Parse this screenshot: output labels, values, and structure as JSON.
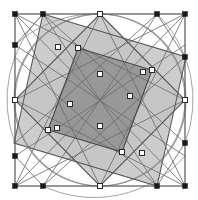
{
  "figure": {
    "type": "geometric-diagram",
    "canvas": {
      "width": 198,
      "height": 200,
      "background": "#ffffff"
    }
  },
  "colors": {
    "background": "#ffffff",
    "stroke_dark": "#3a3a3a",
    "stroke_mid": "#6e6e6e",
    "stroke_light": "#9a9a9a",
    "fill_light_gray": "#c4c4c4",
    "fill_dark_gray": "#989898",
    "node_filled": "#1a1a1a",
    "node_open_fill": "#ffffff",
    "node_open_stroke": "#2a2a2a"
  },
  "frame": {
    "name": "outer-square",
    "x": 15,
    "y": 14,
    "width": 170,
    "height": 172,
    "stroke": "#555555",
    "stroke_width": 1.2
  },
  "circle": {
    "name": "inscribed-circle",
    "cx": 100,
    "cy": 100,
    "r": 86,
    "stroke": "#8a8a8a",
    "stroke_width": 1.1
  },
  "squares": [
    {
      "name": "rotated-square-a",
      "fill": "#c4c4c4",
      "stroke": "#5a5a5a",
      "points": "100,14 185,100 100,186 15,100"
    },
    {
      "name": "rotated-square-b",
      "fill": "#c4c4c4",
      "stroke": "#5a5a5a",
      "points": "43,14 186,57 157,186 14,143"
    }
  ],
  "overlap": {
    "name": "central-overlap-square",
    "fill": "#989898",
    "stroke": "#4a4a4a",
    "points": "78,48 152,70 122,152 48,130"
  },
  "nodes_filled": [
    {
      "name": "node-frame-top-left",
      "cx": 15,
      "cy": 14
    },
    {
      "name": "node-top-left-mid",
      "cx": 43,
      "cy": 14
    },
    {
      "name": "node-top-right-mid",
      "cx": 157,
      "cy": 14
    },
    {
      "name": "node-frame-top-right",
      "cx": 185,
      "cy": 14
    },
    {
      "name": "node-left-upper-mid",
      "cx": 15,
      "cy": 45
    },
    {
      "name": "node-right-upper-mid",
      "cx": 185,
      "cy": 57
    },
    {
      "name": "node-left-lower-mid",
      "cx": 15,
      "cy": 156
    },
    {
      "name": "node-right-lower-mid",
      "cx": 185,
      "cy": 143
    },
    {
      "name": "node-frame-bottom-left",
      "cx": 15,
      "cy": 186
    },
    {
      "name": "node-bottom-left-mid",
      "cx": 43,
      "cy": 186
    },
    {
      "name": "node-bottom-right-mid",
      "cx": 157,
      "cy": 186
    },
    {
      "name": "node-frame-bottom-right",
      "cx": 185,
      "cy": 186
    }
  ],
  "nodes_open": [
    {
      "name": "node-apex-top",
      "cx": 100,
      "cy": 14
    },
    {
      "name": "node-apex-right",
      "cx": 185,
      "cy": 100
    },
    {
      "name": "node-apex-bottom",
      "cx": 100,
      "cy": 186
    },
    {
      "name": "node-apex-left",
      "cx": 15,
      "cy": 100
    },
    {
      "name": "node-cross-upper-left",
      "cx": 58,
      "cy": 47
    },
    {
      "name": "node-cross-upper-right",
      "cx": 143,
      "cy": 72
    },
    {
      "name": "node-cross-lower-right",
      "cx": 142,
      "cy": 153
    },
    {
      "name": "node-cross-lower-left",
      "cx": 57,
      "cy": 128
    },
    {
      "name": "node-inner-upper",
      "cx": 78,
      "cy": 48
    },
    {
      "name": "node-inner-right",
      "cx": 152,
      "cy": 70
    },
    {
      "name": "node-inner-lower",
      "cx": 122,
      "cy": 152
    },
    {
      "name": "node-inner-left",
      "cx": 48,
      "cy": 130
    },
    {
      "name": "node-mid-left-edge",
      "cx": 70,
      "cy": 104
    },
    {
      "name": "node-mid-right-edge",
      "cx": 130,
      "cy": 96
    },
    {
      "name": "node-upper-mid",
      "cx": 100,
      "cy": 74
    },
    {
      "name": "node-lower-mid",
      "cx": 100,
      "cy": 126
    }
  ],
  "chords": [
    {
      "name": "chord-diag-tl-br",
      "x1": 15,
      "y1": 14,
      "x2": 185,
      "y2": 186
    },
    {
      "name": "chord-diag-tr-bl",
      "x1": 185,
      "y1": 14,
      "x2": 15,
      "y2": 186
    },
    {
      "name": "chord-top-left-to-left",
      "x1": 43,
      "y1": 14,
      "x2": 15,
      "y2": 45
    },
    {
      "name": "chord-top-right-to-right",
      "x1": 157,
      "y1": 14,
      "x2": 185,
      "y2": 57
    },
    {
      "name": "chord-bottom-left-to-left",
      "x1": 43,
      "y1": 186,
      "x2": 15,
      "y2": 156
    },
    {
      "name": "chord-bottom-right-to-right",
      "x1": 157,
      "y1": 186,
      "x2": 185,
      "y2": 143
    },
    {
      "name": "chord-a1",
      "x1": 15,
      "y1": 14,
      "x2": 100,
      "y2": 186
    },
    {
      "name": "chord-a2",
      "x1": 185,
      "y1": 14,
      "x2": 100,
      "y2": 186
    },
    {
      "name": "chord-a3",
      "x1": 15,
      "y1": 186,
      "x2": 100,
      "y2": 14
    },
    {
      "name": "chord-a4",
      "x1": 185,
      "y1": 186,
      "x2": 100,
      "y2": 14
    },
    {
      "name": "chord-b1",
      "x1": 15,
      "y1": 14,
      "x2": 185,
      "y2": 100
    },
    {
      "name": "chord-b2",
      "x1": 15,
      "y1": 186,
      "x2": 185,
      "y2": 100
    },
    {
      "name": "chord-b3",
      "x1": 185,
      "y1": 14,
      "x2": 15,
      "y2": 100
    },
    {
      "name": "chord-b4",
      "x1": 185,
      "y1": 186,
      "x2": 15,
      "y2": 100
    },
    {
      "name": "chord-c1",
      "x1": 43,
      "y1": 14,
      "x2": 157,
      "y2": 186
    },
    {
      "name": "chord-c2",
      "x1": 157,
      "y1": 14,
      "x2": 43,
      "y2": 186
    },
    {
      "name": "chord-c3",
      "x1": 15,
      "y1": 45,
      "x2": 185,
      "y2": 156
    },
    {
      "name": "chord-c4",
      "x1": 15,
      "y1": 156,
      "x2": 185,
      "y2": 45
    },
    {
      "name": "chord-d1",
      "x1": 43,
      "y1": 14,
      "x2": 185,
      "y2": 143
    },
    {
      "name": "chord-d2",
      "x1": 157,
      "y1": 14,
      "x2": 15,
      "y2": 143
    },
    {
      "name": "chord-d3",
      "x1": 43,
      "y1": 186,
      "x2": 185,
      "y2": 57
    },
    {
      "name": "chord-d4",
      "x1": 157,
      "y1": 186,
      "x2": 15,
      "y2": 57
    }
  ],
  "arcs": [
    {
      "name": "arc-top-left",
      "d": "M 15,100 A 86,86 0 0 1 100,14"
    },
    {
      "name": "arc-top-right",
      "d": "M 100,14 A 86,86 0 0 1 185,100"
    },
    {
      "name": "arc-bottom-right",
      "d": "M 185,100 A 86,86 0 0 1 100,186"
    },
    {
      "name": "arc-bottom-left",
      "d": "M 100,186 A 86,86 0 0 1 15,100"
    },
    {
      "name": "arc-inner-tl",
      "d": "M 15,45 A 120,120 0 0 1 100,14"
    },
    {
      "name": "arc-inner-tr",
      "d": "M 157,14 A 120,120 0 0 1 185,143"
    },
    {
      "name": "arc-inner-br",
      "d": "M 185,156 A 120,120 0 0 1 43,186"
    },
    {
      "name": "arc-inner-bl",
      "d": "M 15,143 A 120,120 0 0 1 43,14"
    }
  ]
}
